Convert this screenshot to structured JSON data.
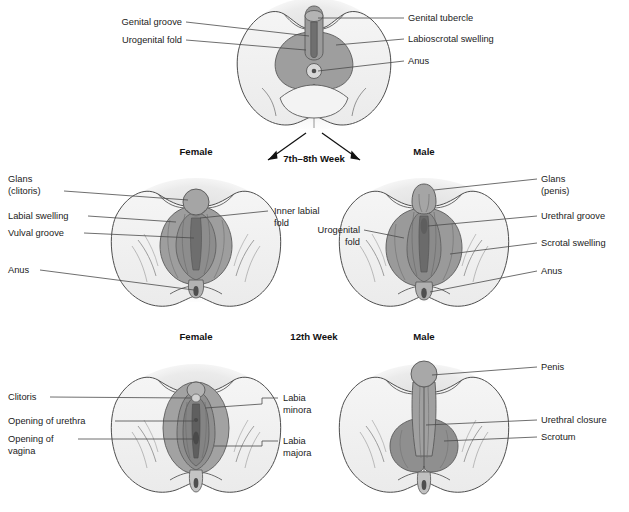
{
  "figure": {
    "kind": "anatomy-diagram",
    "colors": {
      "outline": "#4f4f4f",
      "skin": "#f0f0f0",
      "shadow": "#e3e3e3",
      "mid_gray": "#a8a8a8",
      "dark_gray": "#8d8d8d",
      "darkest_gray": "#767676",
      "leader_line": "#4a4a4a",
      "text": "#1b1b1b",
      "background": "#ffffff"
    }
  },
  "stages": [
    {
      "id": "indifferent",
      "stage_label": "",
      "sex_labels": [],
      "labels_left": [
        {
          "text": "Genital groove",
          "x": 108,
          "y": 25
        },
        {
          "text": "Urogenital fold",
          "x": 108,
          "y": 43
        }
      ],
      "labels_right": [
        {
          "text": "Genital tubercle",
          "x": 408,
          "y": 21
        },
        {
          "text": "Labioscrotal swelling",
          "x": 408,
          "y": 42
        },
        {
          "text": "Anus",
          "x": 408,
          "y": 64
        }
      ],
      "labels_center": []
    },
    {
      "id": "week-7-8",
      "stage_label": "7th–8th Week",
      "sex_labels": [
        {
          "text": "Female",
          "x": 196,
          "y": 155
        },
        {
          "text": "Male",
          "x": 424,
          "y": 155
        }
      ],
      "labels_left": [
        {
          "text": "Glans",
          "x": 8,
          "y": 182
        },
        {
          "text": "(clitoris)",
          "x": 8,
          "y": 194
        },
        {
          "text": "Labial swelling",
          "x": 8,
          "y": 219
        },
        {
          "text": "Vulval groove",
          "x": 8,
          "y": 236
        },
        {
          "text": "Anus",
          "x": 8,
          "y": 273
        }
      ],
      "labels_right": [
        {
          "text": "Glans",
          "x": 541,
          "y": 182
        },
        {
          "text": "(penis)",
          "x": 541,
          "y": 194
        },
        {
          "text": "Urethral groove",
          "x": 541,
          "y": 219
        },
        {
          "text": "Scrotal swelling",
          "x": 541,
          "y": 246
        },
        {
          "text": "Anus",
          "x": 541,
          "y": 274
        }
      ],
      "labels_center": [
        {
          "text": "Inner labial",
          "x": 274,
          "y": 214
        },
        {
          "text": "fold",
          "x": 274,
          "y": 226
        },
        {
          "text": "Urogenital",
          "x": 314,
          "y": 233
        },
        {
          "text": "fold",
          "x": 314,
          "y": 245
        }
      ]
    },
    {
      "id": "week-12",
      "stage_label": "12th Week",
      "sex_labels": [
        {
          "text": "Female",
          "x": 196,
          "y": 340
        },
        {
          "text": "Male",
          "x": 424,
          "y": 340
        }
      ],
      "labels_left": [
        {
          "text": "Clitoris",
          "x": 8,
          "y": 400
        },
        {
          "text": "Opening of urethra",
          "x": 8,
          "y": 424
        },
        {
          "text": "Opening of",
          "x": 8,
          "y": 442
        },
        {
          "text": "vagina",
          "x": 8,
          "y": 454
        }
      ],
      "labels_right": [
        {
          "text": "Penis",
          "x": 541,
          "y": 370
        },
        {
          "text": "Urethral closure",
          "x": 541,
          "y": 423
        },
        {
          "text": "Scrotum",
          "x": 541,
          "y": 440
        }
      ],
      "labels_center": [
        {
          "text": "Labia",
          "x": 283,
          "y": 400
        },
        {
          "text": "minora",
          "x": 283,
          "y": 412
        },
        {
          "text": "Labia",
          "x": 283,
          "y": 443
        },
        {
          "text": "majora",
          "x": 283,
          "y": 455
        }
      ]
    }
  ],
  "stage_markers": {
    "week78": {
      "text": "7th–8th Week",
      "x": 314,
      "y": 159
    },
    "week12": {
      "text": "12th Week",
      "x": 314,
      "y": 340
    }
  },
  "icons": {
    "branch_arrow_left": "arrow-down-left-icon",
    "branch_arrow_right": "arrow-down-right-icon"
  }
}
